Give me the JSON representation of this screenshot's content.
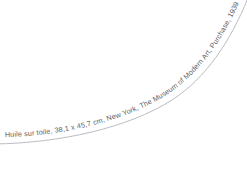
{
  "canvas": {
    "width": 247,
    "height": 172,
    "background_color": "#ffffff"
  },
  "artwork_caption": {
    "full_text": "Huile sur toile, 38,1 x 45,7 cm, New York, The Museum of Modern Art, Purchase, 1939",
    "medium": "Huile sur toile",
    "dimensions": "38,1 x 45,7 cm",
    "city": "New York",
    "institution": "The Museum of Modern Art",
    "credit_line": "Purchase",
    "year": "1939",
    "text_color": "#5d6066"
  },
  "arc": {
    "label": "curved-baseline",
    "stroke_color": "#b9bcc2",
    "stroke_width": 1,
    "start_point": "0,143",
    "end_point": "244,2"
  }
}
